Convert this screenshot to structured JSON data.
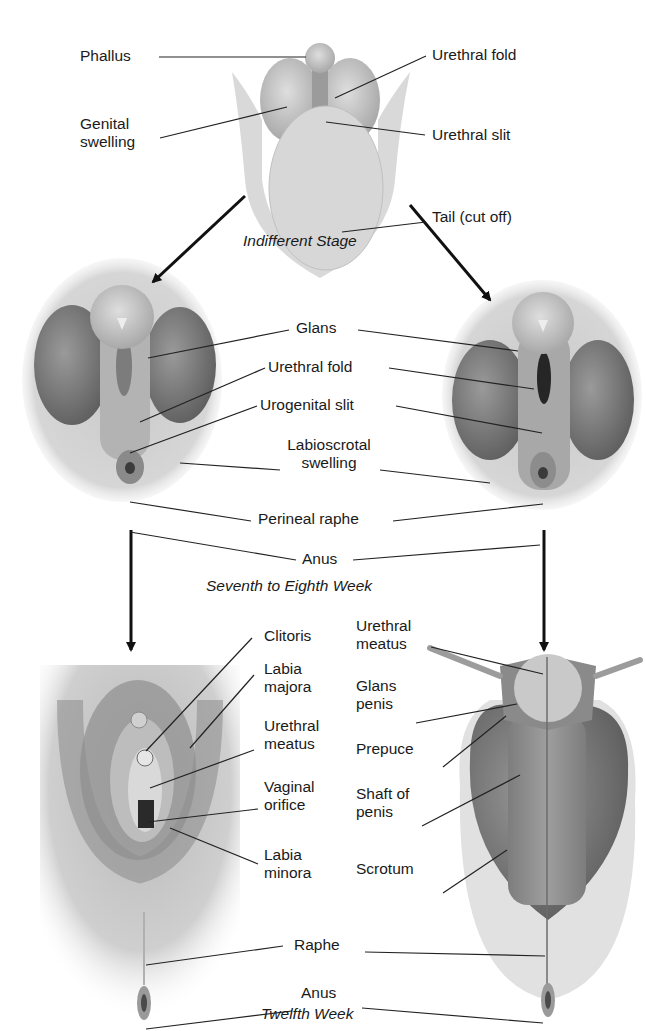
{
  "diagram": {
    "stages": {
      "indifferent": "Indifferent Stage",
      "seventh_eighth": "Seventh to Eighth Week",
      "twelfth": "Twelfth Week"
    },
    "indifferent_labels": {
      "phallus": "Phallus",
      "genital_swelling_1": "Genital",
      "genital_swelling_2": "swelling",
      "urethral_fold": "Urethral fold",
      "urethral_slit": "Urethral slit",
      "tail": "Tail (cut off)"
    },
    "week7_labels": {
      "glans": "Glans",
      "urethral_fold": "Urethral fold",
      "urogenital_slit": "Urogenital slit",
      "labioscrotal_1": "Labioscrotal",
      "labioscrotal_2": "swelling",
      "perineal_raphe": "Perineal raphe",
      "anus": "Anus"
    },
    "female_labels": {
      "clitoris": "Clitoris",
      "labia_majora_1": "Labia",
      "labia_majora_2": "majora",
      "urethral_meatus_1": "Urethral",
      "urethral_meatus_2": "meatus",
      "vaginal_orifice_1": "Vaginal",
      "vaginal_orifice_2": "orifice",
      "labia_minora_1": "Labia",
      "labia_minora_2": "minora"
    },
    "male_labels": {
      "urethral_meatus_1": "Urethral",
      "urethral_meatus_2": "meatus",
      "glans_penis_1": "Glans",
      "glans_penis_2": "penis",
      "prepuce": "Prepuce",
      "shaft_1": "Shaft of",
      "shaft_2": "penis",
      "scrotum": "Scrotum"
    },
    "shared_twelfth_labels": {
      "raphe": "Raphe",
      "anus": "Anus"
    },
    "colors": {
      "skin_light": "#cfcfcf",
      "skin_mid": "#a9a9a9",
      "skin_dark": "#7a7a7a",
      "outline": "#1a1a1a"
    }
  }
}
